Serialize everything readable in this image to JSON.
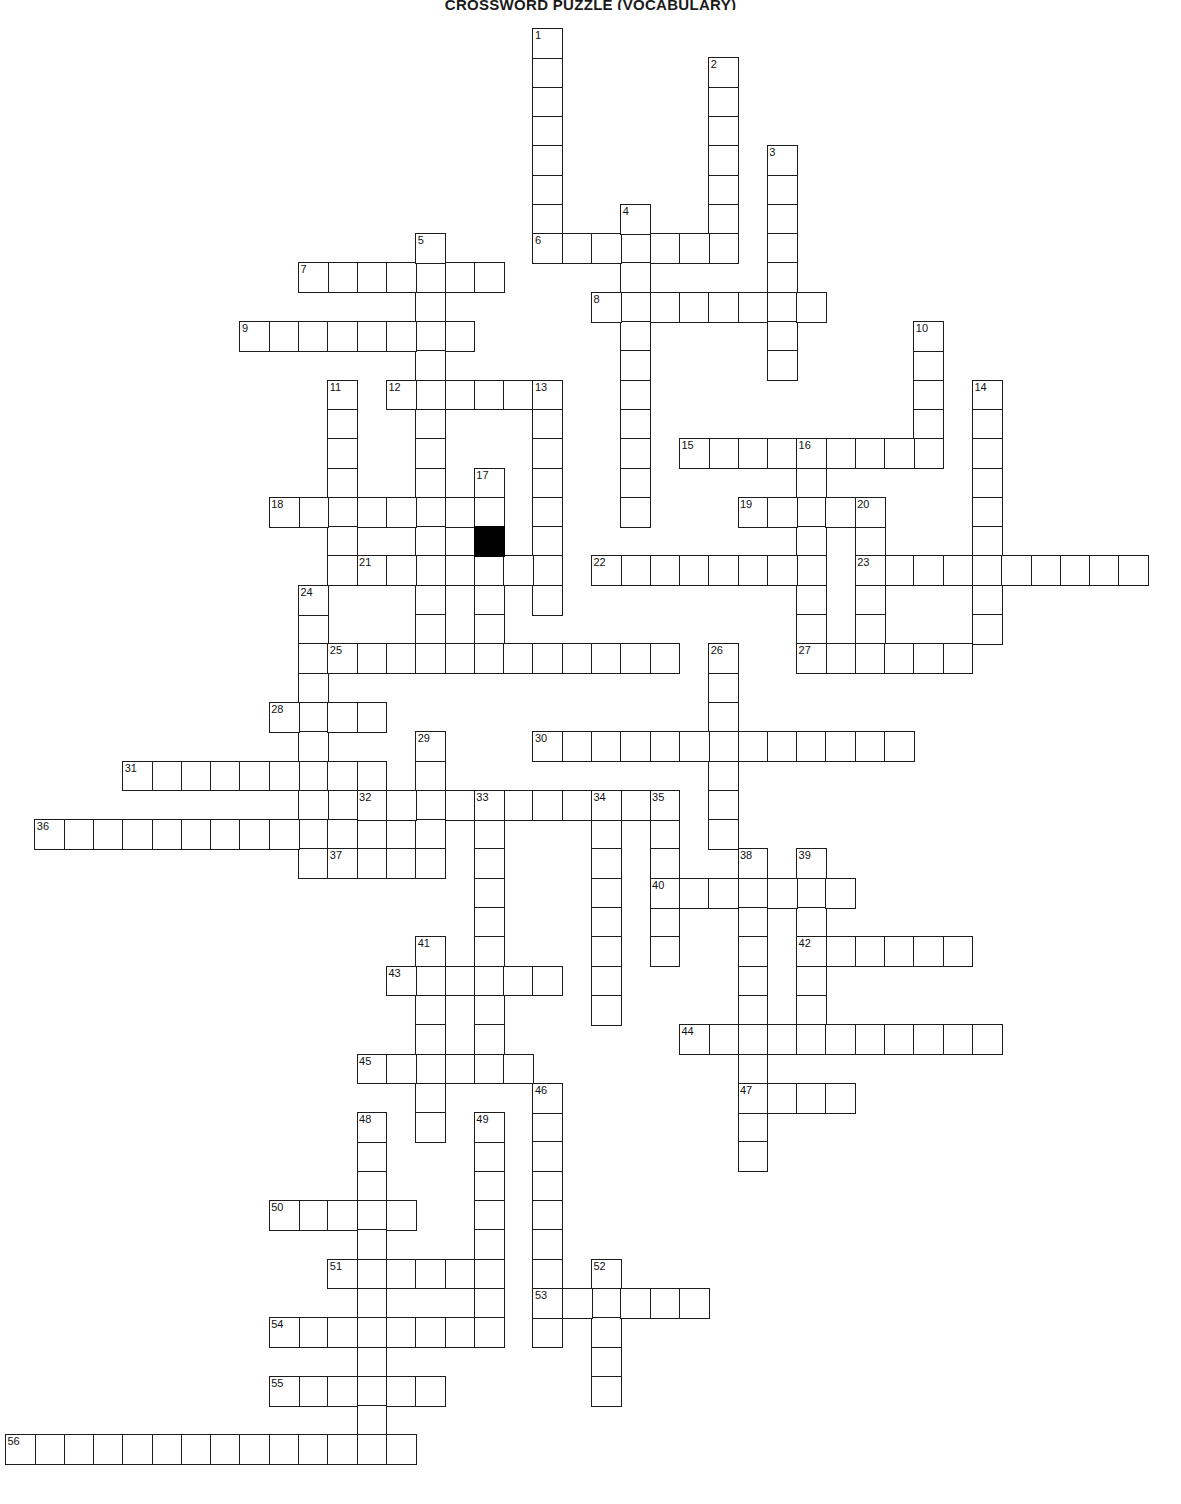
{
  "title": "CROSSWORD PUZZLE (VOCABULARY)",
  "grid": {
    "cell_size": 29.3,
    "origin_x": 5,
    "origin_y": 28,
    "columns": 40,
    "rows": 50,
    "cell_border_color": "#1c1c1c",
    "cell_fill_color": "#ffffff",
    "block_color": "#000000",
    "number_color": "#111111"
  },
  "entries": [
    {
      "number": 1,
      "direction": "down",
      "row": 0,
      "col": 18,
      "length": 8
    },
    {
      "number": 2,
      "direction": "down",
      "row": 1,
      "col": 24,
      "length": 7
    },
    {
      "number": 3,
      "direction": "down",
      "row": 4,
      "col": 26,
      "length": 8
    },
    {
      "number": 4,
      "direction": "down",
      "row": 6,
      "col": 21,
      "length": 11
    },
    {
      "number": 5,
      "direction": "down",
      "row": 7,
      "col": 14,
      "length": 14
    },
    {
      "number": 6,
      "direction": "across",
      "row": 7,
      "col": 18,
      "length": 7
    },
    {
      "number": 7,
      "direction": "across",
      "row": 8,
      "col": 10,
      "length": 7
    },
    {
      "number": 8,
      "direction": "across",
      "row": 9,
      "col": 20,
      "length": 8
    },
    {
      "number": 9,
      "direction": "across",
      "row": 10,
      "col": 8,
      "length": 8
    },
    {
      "number": 10,
      "direction": "down",
      "row": 10,
      "col": 31,
      "length": 5
    },
    {
      "number": 11,
      "direction": "down",
      "row": 12,
      "col": 11,
      "length": 7
    },
    {
      "number": 12,
      "direction": "across",
      "row": 12,
      "col": 13,
      "length": 6
    },
    {
      "number": 13,
      "direction": "down",
      "row": 12,
      "col": 18,
      "length": 8
    },
    {
      "number": 14,
      "direction": "down",
      "row": 12,
      "col": 33,
      "length": 9
    },
    {
      "number": 15,
      "direction": "across",
      "row": 14,
      "col": 23,
      "length": 9
    },
    {
      "number": 16,
      "direction": "down",
      "row": 14,
      "col": 27,
      "length": 7
    },
    {
      "number": 17,
      "direction": "down",
      "row": 15,
      "col": 16,
      "length": 6
    },
    {
      "number": 18,
      "direction": "across",
      "row": 16,
      "col": 9,
      "length": 8
    },
    {
      "number": 19,
      "direction": "across",
      "row": 16,
      "col": 25,
      "length": 5
    },
    {
      "number": 20,
      "direction": "down",
      "row": 16,
      "col": 29,
      "length": 6
    },
    {
      "number": 21,
      "direction": "across",
      "row": 18,
      "col": 12,
      "length": 7
    },
    {
      "number": 22,
      "direction": "across",
      "row": 18,
      "col": 20,
      "length": 8
    },
    {
      "number": 23,
      "direction": "across",
      "row": 18,
      "col": 29,
      "length": 10
    },
    {
      "number": 24,
      "direction": "down",
      "row": 19,
      "col": 10,
      "length": 10
    },
    {
      "number": 25,
      "direction": "across",
      "row": 21,
      "col": 11,
      "length": 12
    },
    {
      "number": 26,
      "direction": "down",
      "row": 21,
      "col": 24,
      "length": 7
    },
    {
      "number": 27,
      "direction": "across",
      "row": 21,
      "col": 27,
      "length": 6
    },
    {
      "number": 28,
      "direction": "across",
      "row": 23,
      "col": 9,
      "length": 4
    },
    {
      "number": 29,
      "direction": "down",
      "row": 24,
      "col": 14,
      "length": 4
    },
    {
      "number": 30,
      "direction": "across",
      "row": 24,
      "col": 18,
      "length": 13
    },
    {
      "number": 31,
      "direction": "across",
      "row": 25,
      "col": 4,
      "length": 9
    },
    {
      "number": 32,
      "direction": "across",
      "row": 26,
      "col": 12,
      "length": 11
    },
    {
      "number": 33,
      "direction": "down",
      "row": 26,
      "col": 16,
      "length": 9
    },
    {
      "number": 34,
      "direction": "down",
      "row": 26,
      "col": 20,
      "length": 8
    },
    {
      "number": 35,
      "direction": "down",
      "row": 26,
      "col": 22,
      "length": 6
    },
    {
      "number": 36,
      "direction": "across",
      "row": 27,
      "col": 1,
      "length": 12
    },
    {
      "number": 37,
      "direction": "across",
      "row": 28,
      "col": 11,
      "length": 4
    },
    {
      "number": 38,
      "direction": "down",
      "row": 28,
      "col": 25,
      "length": 11
    },
    {
      "number": 39,
      "direction": "down",
      "row": 28,
      "col": 27,
      "length": 6
    },
    {
      "number": 40,
      "direction": "across",
      "row": 29,
      "col": 22,
      "length": 7
    },
    {
      "number": 41,
      "direction": "down",
      "row": 31,
      "col": 14,
      "length": 7
    },
    {
      "number": 42,
      "direction": "across",
      "row": 31,
      "col": 27,
      "length": 6
    },
    {
      "number": 43,
      "direction": "across",
      "row": 32,
      "col": 13,
      "length": 6
    },
    {
      "number": 44,
      "direction": "across",
      "row": 34,
      "col": 23,
      "length": 11
    },
    {
      "number": 45,
      "direction": "across",
      "row": 35,
      "col": 12,
      "length": 6
    },
    {
      "number": 46,
      "direction": "down",
      "row": 36,
      "col": 18,
      "length": 9
    },
    {
      "number": 47,
      "direction": "across",
      "row": 36,
      "col": 25,
      "length": 4
    },
    {
      "number": 48,
      "direction": "down",
      "row": 37,
      "col": 12,
      "length": 12
    },
    {
      "number": 49,
      "direction": "down",
      "row": 37,
      "col": 16,
      "length": 8
    },
    {
      "number": 50,
      "direction": "across",
      "row": 40,
      "col": 9,
      "length": 5
    },
    {
      "number": 51,
      "direction": "across",
      "row": 42,
      "col": 11,
      "length": 5
    },
    {
      "number": 52,
      "direction": "down",
      "row": 42,
      "col": 20,
      "length": 5
    },
    {
      "number": 53,
      "direction": "across",
      "row": 43,
      "col": 18,
      "length": 6
    },
    {
      "number": 54,
      "direction": "across",
      "row": 44,
      "col": 9,
      "length": 8
    },
    {
      "number": 55,
      "direction": "across",
      "row": 46,
      "col": 9,
      "length": 6
    },
    {
      "number": 56,
      "direction": "across",
      "row": 48,
      "col": 0,
      "length": 14
    }
  ],
  "blocks": [
    {
      "row": 17,
      "col": 16
    }
  ]
}
